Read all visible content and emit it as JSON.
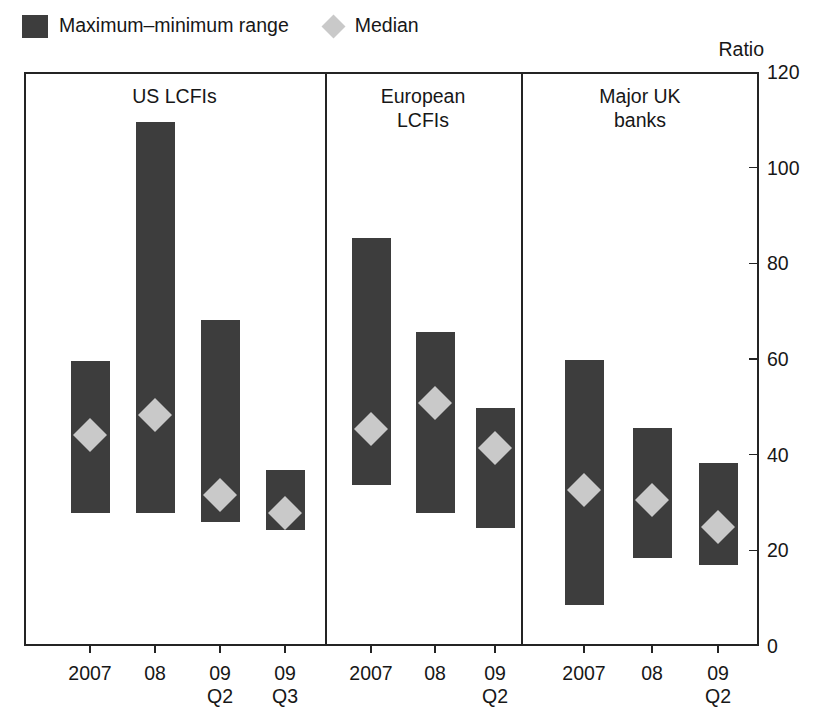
{
  "legend": {
    "items": [
      {
        "icon": "range-swatch-icon",
        "label": "Maximum–minimum range"
      },
      {
        "icon": "median-diamond-icon",
        "label": "Median"
      }
    ]
  },
  "axis_caption": "Ratio",
  "colors": {
    "bar": "#3d3d3d",
    "median": "#c9c9c9",
    "axis": "#242424",
    "text": "#171717",
    "background": "#ffffff"
  },
  "chart_data": {
    "type": "bar",
    "subtype": "floating-range-bar-with-median-marker",
    "title": "",
    "subtitle": "",
    "xlabel": "",
    "ylabel": "Ratio",
    "ylim": [
      0,
      120
    ],
    "yticks": [
      0,
      20,
      40,
      60,
      80,
      100,
      120
    ],
    "ytick_labels": [
      "0",
      "20",
      "40",
      "60",
      "80",
      "100",
      "120"
    ],
    "grid": false,
    "legend_position": "top-left",
    "legend_entries": [
      "Maximum–minimum range",
      "Median"
    ],
    "panels": [
      {
        "name": "US LCFIs",
        "title_lines": [
          "US LCFIs"
        ],
        "categories": [
          "2007",
          "08",
          "09\nQ2",
          "09\nQ3"
        ],
        "category_labels": [
          {
            "line1": "2007",
            "line2": ""
          },
          {
            "line1": "08",
            "line2": ""
          },
          {
            "line1": "09",
            "line2": "Q2"
          },
          {
            "line1": "09",
            "line2": "Q3"
          }
        ],
        "max": [
          59.6,
          109.6,
          68.2,
          36.8
        ],
        "min": [
          27.8,
          27.8,
          25.9,
          24.3
        ],
        "median": [
          44.1,
          48.3,
          31.6,
          27.8
        ]
      },
      {
        "name": "European LCFIs",
        "title_lines": [
          "European",
          "LCFIs"
        ],
        "categories": [
          "2007",
          "08",
          "09\nQ2"
        ],
        "category_labels": [
          {
            "line1": "2007",
            "line2": ""
          },
          {
            "line1": "08",
            "line2": ""
          },
          {
            "line1": "09",
            "line2": "Q2"
          }
        ],
        "max": [
          85.3,
          65.6,
          49.8
        ],
        "min": [
          33.7,
          27.8,
          24.7
        ],
        "median": [
          45.4,
          50.8,
          41.4
        ]
      },
      {
        "name": "Major UK banks",
        "title_lines": [
          "Major UK",
          "banks"
        ],
        "categories": [
          "2007",
          "08",
          "09\nQ2"
        ],
        "category_labels": [
          {
            "line1": "2007",
            "line2": ""
          },
          {
            "line1": "08",
            "line2": ""
          },
          {
            "line1": "09",
            "line2": "Q2"
          }
        ],
        "max": [
          59.8,
          45.6,
          38.3
        ],
        "min": [
          8.6,
          18.4,
          16.9
        ],
        "median": [
          32.6,
          30.5,
          24.9
        ]
      }
    ]
  }
}
